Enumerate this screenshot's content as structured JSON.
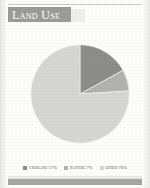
{
  "panel": {
    "title": "Land Use"
  },
  "chart_data": {
    "type": "pie",
    "title": "Land Use",
    "xlabel": "",
    "ylabel": "",
    "units": "percent",
    "start_angle_deg": 0,
    "direction": "clockwise",
    "legend_position": "bottom",
    "grid": false,
    "categories": [
      "Cropland",
      "Pasture",
      "Other"
    ],
    "values": [
      17,
      7,
      76
    ],
    "slice_colors": [
      "#8d8d8b",
      "#b2b2b0",
      "#d6d6d4"
    ],
    "slices": [
      {
        "label": "Cropland",
        "value": 17,
        "legend_text": "Cropland 17%",
        "color": "#8d8d8b"
      },
      {
        "label": "Pasture",
        "value": 7,
        "legend_text": "Pasture 7%",
        "color": "#b2b2b0"
      },
      {
        "label": "Other",
        "value": 76,
        "legend_text": "Other 76%",
        "color": "#d6d6d4"
      }
    ]
  },
  "legend": {
    "items": [
      {
        "text": "Cropland 17%",
        "color": "#8d8d8b"
      },
      {
        "text": "Pasture 7%",
        "color": "#b2b2b0"
      },
      {
        "text": "Other 76%",
        "color": "#d6d6d4"
      }
    ]
  },
  "colors": {
    "title_band": "#9b9b99",
    "title_text": "#ffffff",
    "footer_band": "#a6a6a4",
    "page": "#fdfdfc"
  }
}
